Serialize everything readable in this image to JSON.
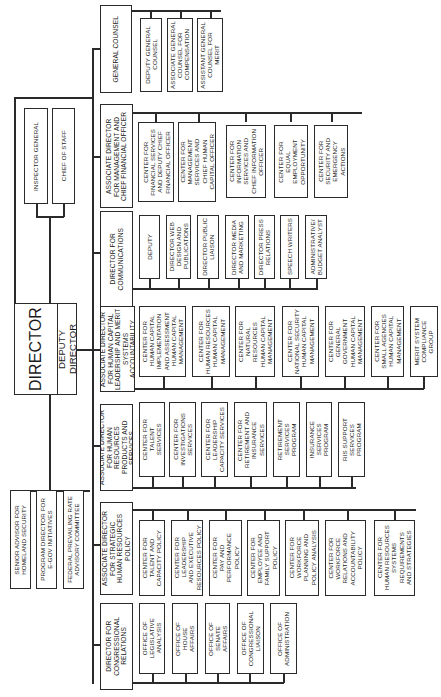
{
  "chart": {
    "orientation": "rotated-90-ccw",
    "top": {
      "director": "DIRECTOR",
      "deputy_director": "DEPUTY DIRECTOR"
    },
    "staff_offices": [
      "INSPECTOR GENERAL",
      "CHIEF OF STAFF"
    ],
    "advisory": [
      "SENIOR ADVISOR FOR\nHOMELAND SECURITY",
      "PROGRAM DIRECTOR FOR\nE-GOV INITIATIVES",
      "FEDERAL PREVAILING RATE\nADVISORY COMMITTEE"
    ],
    "general_counsel": {
      "head": "GENERAL COUNSEL",
      "units": [
        "DEPUTY GENERAL\nCOUNSEL",
        "ASSOCIATE GENERAL\nCOUNSEL FOR\nCOMPENSATION",
        "ASSISTANT GENERAL\nCOUNSEL FOR\nMERIT"
      ]
    },
    "divisions": [
      {
        "head": "ASSOCIATE DIRECTOR\nFOR MANAGEMENT AND\nCHIEF FINANCIAL OFFICER",
        "units": [
          "CENTER FOR\nFINANCIAL SERVICES\nAND DEPUTY CHIEF\nFINANCIAL OFFICER",
          "CENTER FOR\nMANAGEMENT\nSERVICES AND\nCHIEF HUMAN\nCAPITAL OFFICER",
          "CENTER FOR\nINFORMATION\nSERVICES AND\nCHIEF INFORMATION\nOFFICER",
          "CENTER FOR\nEQUAL\nEMPLOYMENT\nOPPORTUNITY",
          "CENTER FOR\nSECURITY AND\nEMERGENCY\nACTIONS"
        ]
      },
      {
        "head": "DIRECTOR FOR\nCOMMUNICATIONS",
        "units": [
          "DEPUTY",
          "DIRECTOR WEB\nDESIGN AND\nPUBLICATIONS",
          "DIRECTOR PUBLIC\nLIAISON",
          "DIRECTOR MEDIA\nAND MARKETING",
          "DIRECTOR PRESS\nRELATIONS",
          "SPEECH WRITERS",
          "ADMINISTRATIVE/\nBUDGET ANALYST"
        ]
      },
      {
        "head": "ASSOCIATE DIRECTOR\nFOR HUMAN CAPITAL\nLEADERSHIP AND MERIT\nSYSTEMS ACCOUNTABILITY",
        "units": [
          "CENTER FOR\nHUMAN CAPITAL\nIMPLEMENTATION\nAND ASSESSMENT\nHUMAN CAPITAL\nMANAGEMENT",
          "CENTER FOR\nHUMAN RESOURCES\nHUMAN CAPITAL\nMANAGEMENT",
          "CENTER FOR\nNATURAL\nRESOURCES\nHUMAN CAPITAL\nMANAGEMENT",
          "CENTER FOR\nNATIONAL SECURITY\nHUMAN CAPITAL\nMANAGEMENT",
          "CENTER FOR\nGENERAL\nGOVERNMENT\nHUMAN CAPITAL\nMANAGEMENT",
          "CENTER FOR\nSMALL AGENCIES\nHUMAN CAPITAL\nMANAGEMENT",
          "MERIT SYSTEM\nCOMPLIANCE\nGROUP"
        ]
      },
      {
        "head": "ASSOCIATE DIRECTOR\nFOR HUMAN RESOURCES\nPRODUCTS AND SERVICES",
        "units": [
          "CENTER FOR\nTALENT\nSERVICES",
          "CENTER FOR\nINVESTIGATIONS\nSERVICES",
          "CENTER FOR\nLEADERSHIP\nCAPACITY SERVICES",
          "CENTER FOR\nRETIREMENT AND\nINSURANCE\nSERVICES",
          "RETIREMENT\nSERVICES\nPROGRAM",
          "INSURANCE\nSERVICES\nPROGRAM",
          "RIS SUPPORT\nSERVICES\nPROGRAM"
        ]
      },
      {
        "head": "ASSOCIATE DIRECTOR\nFOR STRATEGIC\nHUMAN RESOURCES POLICY",
        "units": [
          "CENTER FOR\nTALENT AND\nCAPACITY POLICY",
          "CENTER FOR\nLEADERSHIP\nAND EXECUTIVE\nRESOURCES POLICY",
          "CENTER FOR\nPAY AND\nPERFORMANCE\nPOLICY",
          "CENTER FOR\nEMPLOYEE AND\nFAMILY SUPPORT\nPOLICY",
          "CENTER FOR\nWORKFORCE\nPLANNING AND\nPOLICY ANALYSIS",
          "CENTER FOR\nWORKFORCE\nRELATIONS AND\nACCOUNTABILITY\nPOLICY",
          "CENTER FOR\nHUMAN RESOURCES\nSYSTEMS\nREQUIREMENTS\nAND STRATEGIES"
        ]
      },
      {
        "head": "DIRECTOR FOR\nCONGRESSIONAL\nRELATIONS",
        "units": [
          "OFFICE OF\nLEGISLATIVE\nANALYSIS",
          "OFFICE OF\nHOUSE\nAFFAIRS",
          "OFFICE OF\nSENATE\nAFFAIRS",
          "OFFICE OF\nCONGRESSIONAL\nLIAISON",
          "OFFICE OF\nADMINISTRATION"
        ]
      }
    ]
  }
}
